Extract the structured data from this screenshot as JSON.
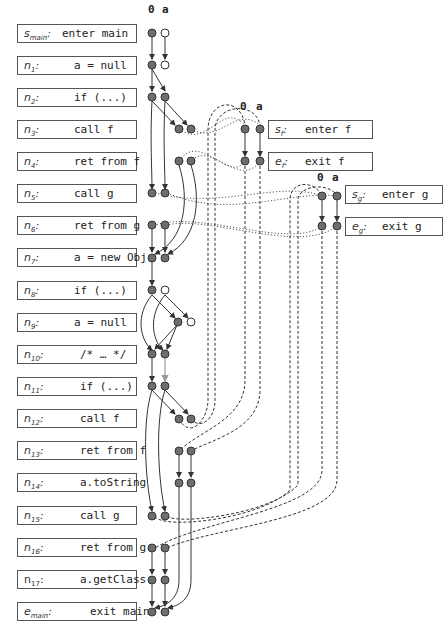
{
  "diagram": {
    "fact_columns": [
      "0",
      "a"
    ],
    "main_statements": [
      {
        "id": "s_main",
        "label": "s",
        "sub": "main",
        "code": "enter main"
      },
      {
        "id": "n1",
        "label": "n",
        "sub": "1",
        "code": "a = null"
      },
      {
        "id": "n2",
        "label": "n",
        "sub": "2",
        "code": "if (...)"
      },
      {
        "id": "n3",
        "label": "n",
        "sub": "3",
        "code": "call f"
      },
      {
        "id": "n4",
        "label": "n",
        "sub": "4",
        "code": "ret from f"
      },
      {
        "id": "n5",
        "label": "n",
        "sub": "5",
        "code": "call g"
      },
      {
        "id": "n6",
        "label": "n",
        "sub": "6",
        "code": "ret from g"
      },
      {
        "id": "n7",
        "label": "n",
        "sub": "7",
        "code": "a = new Obj"
      },
      {
        "id": "n8",
        "label": "n",
        "sub": "8",
        "code": "if (...)"
      },
      {
        "id": "n9",
        "label": "n",
        "sub": "9",
        "code": "a = null"
      },
      {
        "id": "n10",
        "label": "n",
        "sub": "10",
        "code": "/* … */"
      },
      {
        "id": "n11",
        "label": "n",
        "sub": "11",
        "code": "if (...)"
      },
      {
        "id": "n12",
        "label": "n",
        "sub": "12",
        "code": "call f"
      },
      {
        "id": "n13",
        "label": "n",
        "sub": "13",
        "code": "ret from f"
      },
      {
        "id": "n14",
        "label": "n",
        "sub": "14",
        "code": "a.toString"
      },
      {
        "id": "n15",
        "label": "n",
        "sub": "15",
        "code": "call g"
      },
      {
        "id": "n16",
        "label": "n",
        "sub": "16",
        "code": "ret from g"
      },
      {
        "id": "n17",
        "label": "n",
        "sub": "17",
        "code": "a.getClass"
      },
      {
        "id": "e_main",
        "label": "e",
        "sub": "main",
        "code": "exit main"
      }
    ],
    "procedure_f": {
      "entry": {
        "label": "s",
        "sub": "f",
        "code": "enter f"
      },
      "exit": {
        "label": "e",
        "sub": "f",
        "code": "exit f"
      },
      "fact_columns": [
        "0",
        "a"
      ]
    },
    "procedure_g": {
      "entry": {
        "label": "s",
        "sub": "g",
        "code": "enter g"
      },
      "exit": {
        "label": "e",
        "sub": "g",
        "code": "exit g"
      },
      "fact_columns": [
        "0",
        "a"
      ]
    },
    "colors": {
      "filled_node": "#6e6e6e",
      "hollow_node": "#ffffff",
      "edge": "#333333",
      "highlight_edge": "#999999"
    }
  }
}
